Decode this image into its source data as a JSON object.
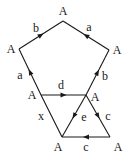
{
  "diagram": {
    "type": "graph",
    "vertices": [
      {
        "id": "top",
        "label": "A",
        "x": 63,
        "y": 21,
        "lx": 63,
        "ly": 11
      },
      {
        "id": "left",
        "label": "A",
        "x": 19,
        "y": 49,
        "lx": 11,
        "ly": 49
      },
      {
        "id": "right",
        "label": "A",
        "x": 109,
        "y": 50,
        "lx": 117,
        "ly": 50
      },
      {
        "id": "midleft",
        "label": "A",
        "x": 41,
        "y": 95,
        "lx": 32,
        "ly": 95
      },
      {
        "id": "midright",
        "label": "A",
        "x": 86,
        "y": 95,
        "lx": 95,
        "ly": 97
      },
      {
        "id": "botleft",
        "label": "A",
        "x": 62,
        "y": 137,
        "lx": 58,
        "ly": 147
      },
      {
        "id": "botright",
        "label": "A",
        "x": 110,
        "y": 137,
        "lx": 118,
        "ly": 147
      }
    ],
    "edges": [
      {
        "id": "b-top-left",
        "label": "b",
        "from": "left",
        "to": "top",
        "arrow": "to",
        "lx": 36,
        "ly": 28
      },
      {
        "id": "a-top-right",
        "label": "a",
        "from": "right",
        "to": "top",
        "arrow": "to",
        "lx": 89,
        "ly": 27
      },
      {
        "id": "a-left",
        "label": "a",
        "from": "midleft",
        "to": "left",
        "arrow": "to",
        "lx": 20,
        "ly": 75
      },
      {
        "id": "b-right",
        "label": "b",
        "from": "midright",
        "to": "right",
        "arrow": "to",
        "lx": 105,
        "ly": 76
      },
      {
        "id": "d-mid",
        "label": "d",
        "from": "midleft",
        "to": "midright",
        "arrow": "to",
        "lx": 61,
        "ly": 85
      },
      {
        "id": "x-left",
        "label": "x",
        "from": "midleft",
        "to": "botleft",
        "arrow": "none",
        "lx": 41,
        "ly": 116
      },
      {
        "id": "e-diag",
        "label": "e",
        "from": "midright",
        "to": "botleft",
        "arrow": "to",
        "lx": 84,
        "ly": 117
      },
      {
        "id": "c-right",
        "label": "c",
        "from": "midright",
        "to": "botright",
        "arrow": "to",
        "lx": 108,
        "ly": 116
      },
      {
        "id": "c-bottom",
        "label": "c",
        "from": "botright",
        "to": "botleft",
        "arrow": "to",
        "lx": 86,
        "ly": 147
      }
    ],
    "colors": {
      "stroke": "#1a1a1a",
      "background": "#ffffff"
    }
  }
}
